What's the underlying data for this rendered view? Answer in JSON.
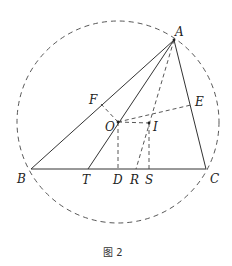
{
  "figure": {
    "caption": "图 2",
    "stroke_color": "#333333",
    "circle": {
      "cx": 118,
      "cy": 122,
      "r": 101,
      "style": "dashed"
    },
    "points": {
      "A": {
        "x": 174,
        "y": 40,
        "label": "A"
      },
      "B": {
        "x": 31,
        "y": 169,
        "label": "B"
      },
      "C": {
        "x": 206,
        "y": 169,
        "label": "C"
      },
      "O": {
        "x": 118,
        "y": 122,
        "label": "O"
      },
      "I": {
        "x": 149,
        "y": 123,
        "label": "I"
      },
      "E": {
        "x": 191,
        "y": 105,
        "label": "E"
      },
      "F": {
        "x": 101,
        "y": 104,
        "label": "F"
      },
      "T": {
        "x": 88,
        "y": 169,
        "label": "T"
      },
      "D": {
        "x": 118,
        "y": 169,
        "label": "D"
      },
      "R": {
        "x": 136,
        "y": 169,
        "label": "R"
      },
      "S": {
        "x": 149,
        "y": 169,
        "label": "S"
      }
    },
    "solid_segments": [
      "AB",
      "AC",
      "BC",
      "AT"
    ],
    "dashed_segments": [
      "AR",
      "OE",
      "OI",
      "OD",
      "IS",
      "OF"
    ]
  }
}
